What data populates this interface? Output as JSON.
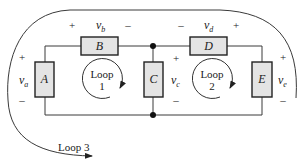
{
  "diagram": {
    "type": "circuit",
    "components": [
      {
        "id": "A",
        "label": "A",
        "voltage": "v",
        "voltage_sub": "a",
        "plus": "+",
        "minus": "–"
      },
      {
        "id": "B",
        "label": "B",
        "voltage": "v",
        "voltage_sub": "b",
        "plus": "+",
        "minus": "–"
      },
      {
        "id": "C",
        "label": "C",
        "voltage": "v",
        "voltage_sub": "c",
        "plus": "+",
        "minus": "–"
      },
      {
        "id": "D",
        "label": "D",
        "voltage": "v",
        "voltage_sub": "d",
        "plus": "+",
        "minus": "–"
      },
      {
        "id": "E",
        "label": "E",
        "voltage": "v",
        "voltage_sub": "e",
        "plus": "+",
        "minus": "–"
      }
    ],
    "loops": [
      {
        "line1": "Loop",
        "line2": "1"
      },
      {
        "line1": "Loop",
        "line2": "2"
      },
      {
        "line1": "Loop 3"
      }
    ],
    "colors": {
      "component_fill": "#e4e4e4",
      "stroke": "#222222"
    }
  }
}
